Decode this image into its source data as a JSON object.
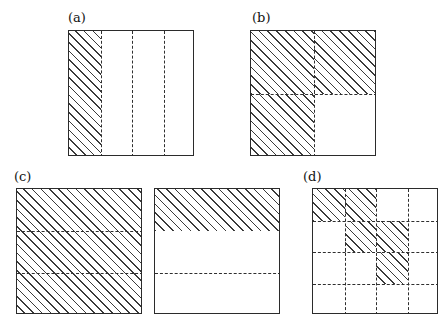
{
  "figure": {
    "caption_style": "parenthesized-letters",
    "background_color": "#ffffff",
    "line_color": "#2b2b2b",
    "hatch_color": "#3a3a3a"
  },
  "panels": [
    {
      "id": "a",
      "label": "(a)",
      "label_x": 68,
      "label_y": 11,
      "squares": [
        {
          "x": 68,
          "y": 30,
          "size": 126,
          "subdivision": "vertical-strips",
          "strips": 4,
          "internal_lines": [
            {
              "orientation": "vertical",
              "position_fraction": 0.25,
              "style": "dashed"
            },
            {
              "orientation": "vertical",
              "position_fraction": 0.5,
              "style": "dashed"
            },
            {
              "orientation": "vertical",
              "position_fraction": 0.75,
              "style": "dashed"
            }
          ],
          "hatched_regions": [
            {
              "x_fraction": 0.0,
              "y_fraction": 0.0,
              "w_fraction": 0.25,
              "h_fraction": 1.0
            }
          ]
        }
      ]
    },
    {
      "id": "b",
      "label": "(b)",
      "label_x": 252,
      "label_y": 11,
      "squares": [
        {
          "x": 250,
          "y": 30,
          "size": 126,
          "subdivision": "quadrants",
          "strips": 4,
          "internal_lines": [
            {
              "orientation": "vertical",
              "position_fraction": 0.5,
              "style": "dashed"
            },
            {
              "orientation": "horizontal",
              "position_fraction": 0.5,
              "style": "dashed"
            }
          ],
          "hatched_regions": [
            {
              "x_fraction": 0.0,
              "y_fraction": 0.0,
              "w_fraction": 0.5,
              "h_fraction": 0.5
            },
            {
              "x_fraction": 0.5,
              "y_fraction": 0.0,
              "w_fraction": 0.5,
              "h_fraction": 0.5
            },
            {
              "x_fraction": 0.0,
              "y_fraction": 0.5,
              "w_fraction": 0.5,
              "h_fraction": 0.5
            }
          ]
        }
      ]
    },
    {
      "id": "c",
      "label": "(c)",
      "label_x": 14,
      "label_y": 170,
      "squares": [
        {
          "x": 16,
          "y": 188,
          "size": 126,
          "subdivision": "horizontal-bands",
          "strips": 3,
          "internal_lines": [
            {
              "orientation": "horizontal",
              "position_fraction": 0.3333,
              "style": "dashed"
            },
            {
              "orientation": "horizontal",
              "position_fraction": 0.6667,
              "style": "dashed"
            }
          ],
          "hatched_regions": [
            {
              "x_fraction": 0.0,
              "y_fraction": 0.0,
              "w_fraction": 1.0,
              "h_fraction": 1.0
            }
          ]
        },
        {
          "x": 154,
          "y": 188,
          "size": 126,
          "subdivision": "horizontal-bands",
          "strips": 3,
          "internal_lines": [
            {
              "orientation": "horizontal",
              "position_fraction": 0.6667,
              "style": "dashed"
            }
          ],
          "hatched_regions": [
            {
              "x_fraction": 0.0,
              "y_fraction": 0.0,
              "w_fraction": 1.0,
              "h_fraction": 0.3333
            }
          ]
        }
      ]
    },
    {
      "id": "d",
      "label": "(d)",
      "label_x": 303,
      "label_y": 170,
      "squares": [
        {
          "x": 312,
          "y": 188,
          "size": 126,
          "subdivision": "grid-4x4",
          "strips": 4,
          "internal_lines": [
            {
              "orientation": "vertical",
              "position_fraction": 0.25,
              "style": "dashed"
            },
            {
              "orientation": "vertical",
              "position_fraction": 0.5,
              "style": "dashed"
            },
            {
              "orientation": "vertical",
              "position_fraction": 0.75,
              "style": "dashed"
            },
            {
              "orientation": "horizontal",
              "position_fraction": 0.25,
              "style": "dashed"
            },
            {
              "orientation": "horizontal",
              "position_fraction": 0.5,
              "style": "dashed"
            },
            {
              "orientation": "horizontal",
              "position_fraction": 0.75,
              "style": "dashed"
            }
          ],
          "hatched_cells": [
            {
              "row": 0,
              "col": 0
            },
            {
              "row": 0,
              "col": 1
            },
            {
              "row": 1,
              "col": 1
            },
            {
              "row": 1,
              "col": 2
            },
            {
              "row": 2,
              "col": 2
            }
          ]
        }
      ]
    }
  ]
}
